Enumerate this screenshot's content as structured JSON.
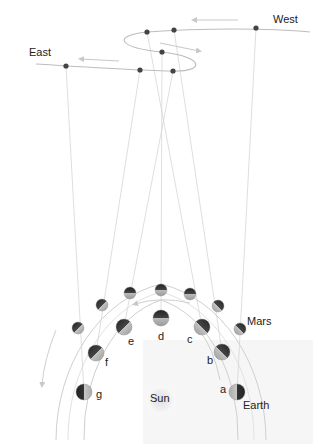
{
  "labels": {
    "west": "West",
    "east": "East",
    "mars": "Mars",
    "earth": "Earth",
    "sun": "Sun"
  },
  "positions": [
    {
      "id": "a"
    },
    {
      "id": "b"
    },
    {
      "id": "c"
    },
    {
      "id": "d"
    },
    {
      "id": "e"
    },
    {
      "id": "f"
    },
    {
      "id": "g"
    }
  ],
  "colors": {
    "orbit": "#cfcfcf",
    "sightline": "#d6d6d6",
    "sky_path": "#bdbdbd",
    "dot": "#444444",
    "arrow": "#c8c8c8",
    "shade_panel": "#f6f6f6"
  }
}
